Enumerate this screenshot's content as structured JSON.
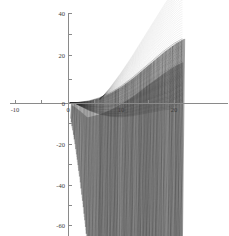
{
  "chart_data": {
    "type": "line",
    "title": "",
    "subtitle": "",
    "xlabel": "",
    "ylabel": "",
    "grid": false,
    "legend": "none",
    "axis_style": "centered-cross",
    "xlim": [
      -12,
      22
    ],
    "ylim": [
      -62,
      42
    ],
    "x_ticks": [
      -10,
      -5,
      0,
      5,
      10,
      15,
      20
    ],
    "x_tick_labels": [
      "-10",
      "",
      "0",
      "",
      "10",
      "",
      "20"
    ],
    "y_ticks": [
      40,
      30,
      20,
      10,
      0,
      -10,
      -20,
      -30,
      -40,
      -50,
      -60
    ],
    "y_tick_labels": [
      "40",
      "",
      "20",
      "",
      "0",
      "",
      "-20",
      "",
      "-40",
      "",
      "-60"
    ],
    "envelope_upper": [
      {
        "x": 0.5,
        "y": 0.0
      },
      {
        "x": 2.0,
        "y": 0.3
      },
      {
        "x": 4.0,
        "y": 1.0
      },
      {
        "x": 6.0,
        "y": 2.4
      },
      {
        "x": 8.0,
        "y": 4.6
      },
      {
        "x": 10.0,
        "y": 7.5
      },
      {
        "x": 12.0,
        "y": 11.0
      },
      {
        "x": 14.0,
        "y": 15.0
      },
      {
        "x": 16.0,
        "y": 19.0
      },
      {
        "x": 18.0,
        "y": 23.0
      },
      {
        "x": 20.0,
        "y": 26.5
      },
      {
        "x": 21.5,
        "y": 28.5
      }
    ],
    "envelope_lower": [
      {
        "x": 0.5,
        "y": -3.0
      },
      {
        "x": 4.0,
        "y": -60.0
      },
      {
        "x": 21.5,
        "y": -62.0
      }
    ],
    "series": [
      {
        "name": "oscillatory-family",
        "color": "#2b2b2b",
        "values": []
      }
    ],
    "ink_color": "#2b2b2b",
    "axis_color": "#8a8a8a",
    "label_color": "#3a3a3a",
    "background": "#ffffff"
  },
  "axes": {
    "x_tick_entries": [
      {
        "value": -10,
        "label": "-10",
        "px": 15
      },
      {
        "value": -5,
        "label": "",
        "px": 41
      },
      {
        "value": 0,
        "label": "0",
        "px": 68
      },
      {
        "value": 5,
        "label": "",
        "px": 94
      },
      {
        "value": 10,
        "label": "10",
        "px": 121
      },
      {
        "value": 15,
        "label": "",
        "px": 148
      },
      {
        "value": 20,
        "label": "20",
        "px": 174
      }
    ],
    "y_tick_entries": [
      {
        "value": 40,
        "label": "40",
        "px": 13
      },
      {
        "value": 30,
        "label": "",
        "px": 34
      },
      {
        "value": 20,
        "label": "20",
        "px": 55
      },
      {
        "value": 10,
        "label": "",
        "px": 79
      },
      {
        "value": 0,
        "label": "0",
        "px": 103
      },
      {
        "value": -10,
        "label": "",
        "px": 123
      },
      {
        "value": -20,
        "label": "-20",
        "px": 144
      },
      {
        "value": -30,
        "label": "",
        "px": 164
      },
      {
        "value": -40,
        "label": "-40",
        "px": 185
      },
      {
        "value": -50,
        "label": "",
        "px": 205
      },
      {
        "value": -60,
        "label": "-60",
        "px": 225
      }
    ]
  }
}
